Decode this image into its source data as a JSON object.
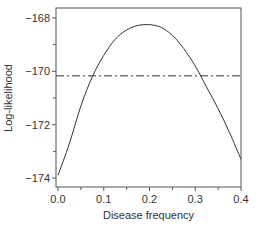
{
  "chart_data": {
    "type": "line",
    "title": "",
    "xlabel": "Disease frequency",
    "ylabel": "Log-likelihood",
    "xlim": [
      0.0,
      0.4
    ],
    "ylim": [
      -174,
      -168
    ],
    "x_ticks": [
      0.0,
      0.1,
      0.2,
      0.3,
      0.4
    ],
    "x_tick_labels": [
      "0.0",
      "0.1",
      "0.2",
      "0.3",
      "0.4"
    ],
    "x_minor_ticks": [
      0.05,
      0.15,
      0.25,
      0.35
    ],
    "y_ticks": [
      -168,
      -170,
      -172,
      -174
    ],
    "y_tick_labels": [
      "−168",
      "−170",
      "−172",
      "−174"
    ],
    "y_minor_ticks": [
      -169,
      -171,
      -173
    ],
    "grid": false,
    "legend": null,
    "series": [
      {
        "name": "log-likelihood",
        "style": "solid",
        "x": [
          0.0,
          0.025,
          0.05,
          0.075,
          0.1,
          0.125,
          0.15,
          0.175,
          0.2,
          0.225,
          0.25,
          0.275,
          0.3,
          0.325,
          0.35,
          0.375,
          0.4
        ],
        "values": [
          -173.9,
          -172.7,
          -171.3,
          -170.2,
          -169.4,
          -168.8,
          -168.45,
          -168.28,
          -168.25,
          -168.35,
          -168.65,
          -169.15,
          -169.8,
          -170.6,
          -171.4,
          -172.3,
          -173.3
        ]
      }
    ],
    "reference_lines": [
      {
        "orientation": "horizontal",
        "y": -170.17,
        "style": "dash-dot",
        "note": "likelihood-based confidence threshold"
      }
    ],
    "annotations": []
  },
  "colors": {
    "line": "#333333",
    "axis": "#555555",
    "text": "#333333",
    "background": "#ffffff"
  }
}
